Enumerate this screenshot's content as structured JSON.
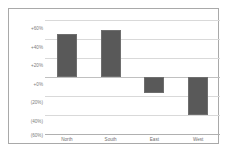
{
  "chart_data": {
    "type": "bar",
    "title": "",
    "subtitle": "",
    "xlabel": "",
    "ylabel": "",
    "categories": [
      "North",
      "South",
      "East",
      "West"
    ],
    "values": [
      45,
      49,
      -17,
      -40
    ],
    "series": [
      {
        "name": "Change",
        "values": [
          45,
          49,
          -17,
          -40
        ]
      }
    ],
    "ylim": [
      -60,
      60
    ],
    "ytick_values": [
      60,
      40,
      20,
      0,
      -20,
      -40,
      -60
    ],
    "ytick_labels": [
      "+60%",
      "+40%",
      "+20%",
      "+0%",
      "(20%)",
      "(40%)",
      "(60%)"
    ],
    "grid": true,
    "legend": false,
    "legend_position": "none",
    "zero_line": 0,
    "negative_format": "parentheses",
    "bar_color": "#595959",
    "bar_border_color": "#6e6e6e",
    "gridline_color": "#d9d9d9",
    "frame_color": "#a9a9a9",
    "tick_label_color": "#7b7b7b",
    "background_color": "#ffffff"
  }
}
